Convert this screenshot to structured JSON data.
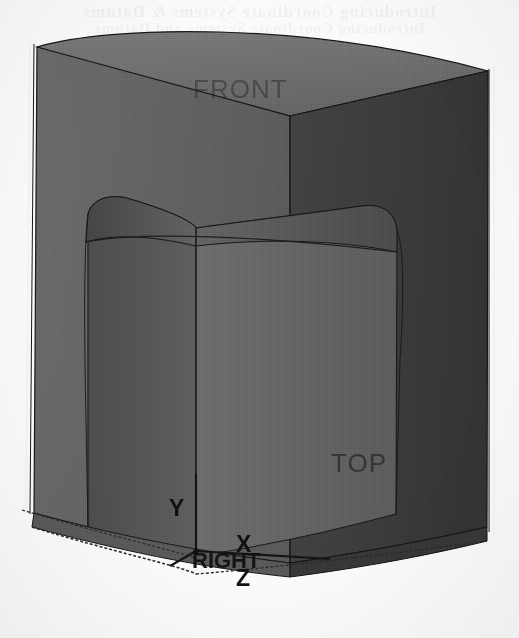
{
  "page": {
    "kind": "cad-3d-solid-model-screenshot",
    "background_color": "#fbfbfb",
    "bleed_through_line_1": "Introducing Coordinate Systems & Datums",
    "bleed_through_line_2": "Introducing Coordinate Systems and Datums"
  },
  "model": {
    "title": "Isometric shaded solid with rounded rectangular pocket",
    "shading": {
      "top_face": "#6e6e6e",
      "left_front_face": "#616161",
      "right_front_face": "#3c3c3c",
      "pocket_left_wall": "#5a5a5a",
      "pocket_right_wall": "#686868",
      "pocket_floor": "#6a6a6a",
      "pocket_fillet_left": "#4f4f4f",
      "pocket_fillet_right": "#575757",
      "edge_line": "#1a1a1a",
      "outline": "#111111",
      "ground_line": "#2a2a2a"
    }
  },
  "datum_labels": {
    "front": "FRONT",
    "top": "TOP",
    "right": "RIGHT"
  },
  "axes": {
    "x_label": "X",
    "y_label": "Y",
    "z_label": "Z",
    "origin_px": [
      196,
      551
    ],
    "x_axis_color": "#1a1a1a",
    "y_axis_color": "#1a1a1a",
    "z_axis_color": "#1a1a1a"
  }
}
